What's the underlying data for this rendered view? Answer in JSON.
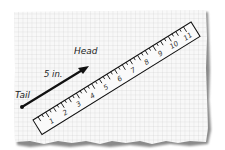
{
  "diagram": {
    "labels": {
      "head": "Head",
      "tail": "Tail",
      "magnitude": "5 in."
    },
    "ruler": {
      "numbers": [
        "1",
        "2",
        "3",
        "4",
        "5",
        "6",
        "7",
        "8",
        "9",
        "10",
        "11"
      ]
    },
    "colors": {
      "paper": "#f7f7f7",
      "grid": "#c9c9c9",
      "ink": "#111111",
      "shadow": "#9a9a9a"
    }
  }
}
